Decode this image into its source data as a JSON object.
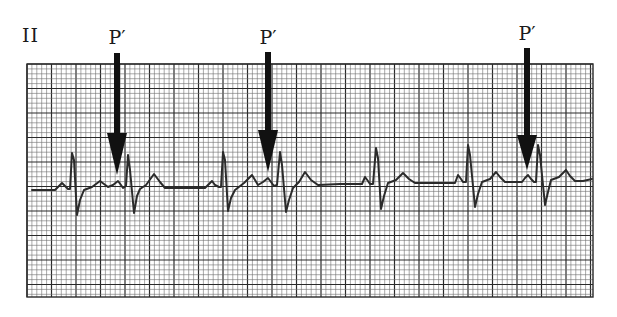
{
  "figure": {
    "lead": "II",
    "colors": {
      "background": "#ffffff",
      "grid_minor": "#6e6e6e",
      "grid_major": "#2a2a2a",
      "trace": "#2b2b2b",
      "arrow": "#111111"
    },
    "grid": {
      "x0": 27,
      "y0": 64,
      "x1": 593,
      "y1": 297,
      "minor": 4.9,
      "major_every": 5
    },
    "annotations": [
      {
        "label": "P′",
        "x": 117,
        "label_y": 26,
        "shaft_top": 53,
        "head_top": 133,
        "tip": 175
      },
      {
        "label": "P′",
        "x": 268,
        "label_y": 26,
        "shaft_top": 52,
        "head_top": 130,
        "tip": 172
      },
      {
        "label": "P′",
        "x": 527,
        "label_y": 22,
        "shaft_top": 48,
        "head_top": 135,
        "tip": 170
      }
    ],
    "trace_points": [
      [
        32,
        190
      ],
      [
        55,
        190
      ],
      [
        59,
        186
      ],
      [
        62,
        183
      ],
      [
        65,
        186
      ],
      [
        68,
        189
      ],
      [
        70,
        189
      ],
      [
        72,
        153
      ],
      [
        74,
        160
      ],
      [
        77,
        215
      ],
      [
        80,
        200
      ],
      [
        84,
        190
      ],
      [
        92,
        187
      ],
      [
        100,
        181
      ],
      [
        104,
        184
      ],
      [
        108,
        187
      ],
      [
        113,
        185
      ],
      [
        118,
        181
      ],
      [
        121,
        185
      ],
      [
        123,
        188
      ],
      [
        126,
        186
      ],
      [
        128,
        155
      ],
      [
        130,
        170
      ],
      [
        134,
        213
      ],
      [
        137,
        196
      ],
      [
        140,
        189
      ],
      [
        146,
        185
      ],
      [
        154,
        174
      ],
      [
        160,
        182
      ],
      [
        165,
        188
      ],
      [
        205,
        188
      ],
      [
        209,
        184
      ],
      [
        212,
        181
      ],
      [
        215,
        185
      ],
      [
        219,
        187
      ],
      [
        221,
        187
      ],
      [
        223,
        152
      ],
      [
        225,
        160
      ],
      [
        228,
        211
      ],
      [
        231,
        198
      ],
      [
        235,
        190
      ],
      [
        244,
        183
      ],
      [
        252,
        175
      ],
      [
        255,
        180
      ],
      [
        258,
        185
      ],
      [
        263,
        182
      ],
      [
        268,
        178
      ],
      [
        271,
        182
      ],
      [
        274,
        186
      ],
      [
        277,
        185
      ],
      [
        280,
        152
      ],
      [
        282,
        165
      ],
      [
        286,
        212
      ],
      [
        289,
        200
      ],
      [
        293,
        188
      ],
      [
        299,
        182
      ],
      [
        305,
        172
      ],
      [
        311,
        180
      ],
      [
        318,
        185
      ],
      [
        340,
        184
      ],
      [
        362,
        184
      ],
      [
        365,
        177
      ],
      [
        368,
        181
      ],
      [
        370,
        184
      ],
      [
        373,
        184
      ],
      [
        376,
        148
      ],
      [
        378,
        158
      ],
      [
        381,
        209
      ],
      [
        384,
        196
      ],
      [
        388,
        183
      ],
      [
        396,
        180
      ],
      [
        403,
        173
      ],
      [
        409,
        179
      ],
      [
        415,
        183
      ],
      [
        455,
        183
      ],
      [
        458,
        175
      ],
      [
        461,
        179
      ],
      [
        463,
        182
      ],
      [
        466,
        182
      ],
      [
        468,
        145
      ],
      [
        470,
        155
      ],
      [
        475,
        207
      ],
      [
        478,
        194
      ],
      [
        482,
        182
      ],
      [
        490,
        179
      ],
      [
        496,
        172
      ],
      [
        500,
        177
      ],
      [
        505,
        182
      ],
      [
        522,
        182
      ],
      [
        525,
        178
      ],
      [
        528,
        175
      ],
      [
        531,
        179
      ],
      [
        534,
        182
      ],
      [
        536,
        182
      ],
      [
        538,
        145
      ],
      [
        540,
        155
      ],
      [
        545,
        205
      ],
      [
        548,
        192
      ],
      [
        551,
        180
      ],
      [
        559,
        177
      ],
      [
        566,
        170
      ],
      [
        570,
        176
      ],
      [
        575,
        181
      ],
      [
        583,
        181
      ],
      [
        592,
        179
      ]
    ]
  },
  "chart_data": {
    "type": "line",
    "lead": "II",
    "annotations": [
      "P′",
      "P′",
      "P′"
    ],
    "beats": 8,
    "premature_beats_marked": 3,
    "xlabel": "",
    "ylabel": ""
  }
}
